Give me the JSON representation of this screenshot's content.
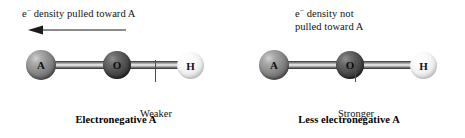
{
  "figure": {
    "panels": [
      {
        "id": "electronegative-a",
        "annotation_line1_prefix": "e",
        "annotation_superscript": "−",
        "annotation_line1_rest": " density pulled toward A",
        "annotation_line2": "",
        "arrow": {
          "present": true,
          "direction": "left",
          "semantic": "electron-density-shift-arrow"
        },
        "atoms": [
          {
            "label": "A",
            "shade": "medium-gray",
            "color": "#8f8f8f"
          },
          {
            "label": "O",
            "shade": "dark-gray",
            "color": "#3c3c3c"
          },
          {
            "label": "H",
            "shade": "white",
            "color": "#f0f0f0"
          }
        ],
        "bond_label_line1": "Weaker",
        "bond_label_line2": "bond",
        "caption": "Electronegative A"
      },
      {
        "id": "less-electronegative-a",
        "annotation_line1_prefix": "e",
        "annotation_superscript": "−",
        "annotation_line1_rest": " density not",
        "annotation_line2": "pulled toward A",
        "arrow": {
          "present": false,
          "direction": "none",
          "semantic": "electron-density-shift-arrow"
        },
        "atoms": [
          {
            "label": "A",
            "shade": "medium-gray",
            "color": "#8f8f8f"
          },
          {
            "label": "O",
            "shade": "dark-gray",
            "color": "#3c3c3c"
          },
          {
            "label": "H",
            "shade": "white",
            "color": "#f0f0f0"
          }
        ],
        "bond_label_line1": "Stronger",
        "bond_label_line2": "bond",
        "caption": "Less electronegative A"
      }
    ],
    "colors": {
      "background": "#ffffff",
      "text": "#111111",
      "bond_stroke": "#4a4a4a",
      "arrow": "#1a1a1a",
      "leader_line": "#4d4d4d"
    }
  }
}
